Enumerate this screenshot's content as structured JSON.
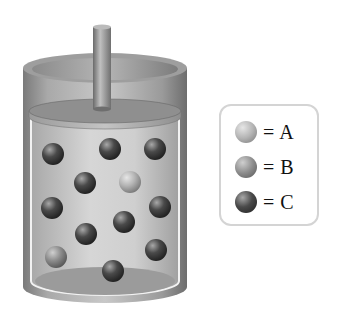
{
  "diagram": {
    "colors": {
      "A": "#b4b4b4",
      "B": "#8c8c8c",
      "C": "#4a4a4a"
    },
    "particles": [
      {
        "type": "C",
        "x": 53,
        "y": 154
      },
      {
        "type": "C",
        "x": 110,
        "y": 149
      },
      {
        "type": "C",
        "x": 155,
        "y": 149
      },
      {
        "type": "C",
        "x": 85,
        "y": 183
      },
      {
        "type": "A",
        "x": 130,
        "y": 182
      },
      {
        "type": "C",
        "x": 52,
        "y": 208
      },
      {
        "type": "C",
        "x": 160,
        "y": 207
      },
      {
        "type": "C",
        "x": 124,
        "y": 222
      },
      {
        "type": "C",
        "x": 86,
        "y": 234
      },
      {
        "type": "B",
        "x": 56,
        "y": 257
      },
      {
        "type": "C",
        "x": 156,
        "y": 250
      },
      {
        "type": "C",
        "x": 113,
        "y": 271
      }
    ],
    "counts": {
      "A": 1,
      "B": 1,
      "C": 10
    }
  },
  "legend": {
    "items": [
      {
        "key": "A",
        "label": "= A"
      },
      {
        "key": "B",
        "label": "= B"
      },
      {
        "key": "C",
        "label": "= C"
      }
    ]
  }
}
